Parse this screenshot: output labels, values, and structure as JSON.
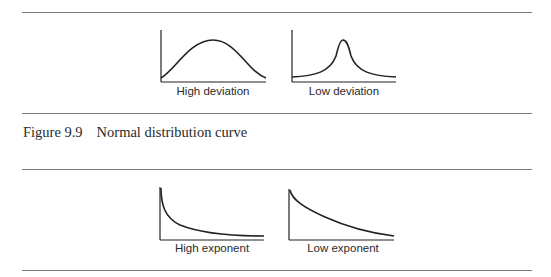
{
  "figure_top": {
    "panels": [
      {
        "label": "High deviation",
        "curve": "normal-wide"
      },
      {
        "label": "Low deviation",
        "curve": "normal-narrow"
      }
    ]
  },
  "caption": {
    "number": "Figure 9.9",
    "text": "Normal distribution curve"
  },
  "figure_bottom": {
    "panels": [
      {
        "label": "High exponent",
        "curve": "power-decay-steep"
      },
      {
        "label": "Low exponent",
        "curve": "power-decay-gentle"
      }
    ]
  }
}
